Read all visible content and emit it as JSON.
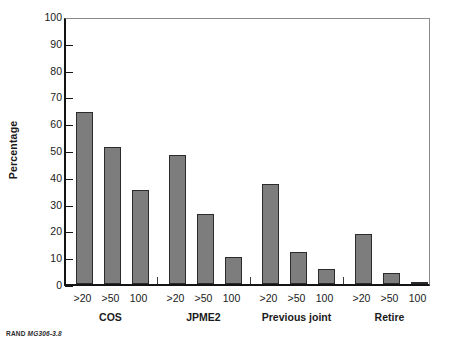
{
  "footer": {
    "prefix": "RAND",
    "figure_id": "MG306-3.8"
  },
  "chart_data": {
    "type": "bar",
    "title": "",
    "xlabel": "",
    "ylabel": "Percentage",
    "ylim": [
      0,
      100
    ],
    "ytick_step": 10,
    "ytick_labels": [
      "0",
      "10",
      "20",
      "30",
      "40",
      "50",
      "60",
      "70",
      "80",
      "90",
      "100"
    ],
    "grid": false,
    "legend": "none",
    "categories": [
      "COS",
      "JPME2",
      "Previous joint",
      "Retire"
    ],
    "subcategories": [
      ">20",
      ">50",
      "100"
    ],
    "groups": [
      {
        "label": "COS",
        "bars": [
          {
            "label": ">20",
            "value": 64
          },
          {
            "label": ">50",
            "value": 51
          },
          {
            "label": "100",
            "value": 35
          }
        ]
      },
      {
        "label": "JPME2",
        "bars": [
          {
            "label": ">20",
            "value": 48
          },
          {
            "label": ">50",
            "value": 26
          },
          {
            "label": "100",
            "value": 10
          }
        ]
      },
      {
        "label": "Previous joint",
        "bars": [
          {
            "label": ">20",
            "value": 37.5
          },
          {
            "label": ">50",
            "value": 12
          },
          {
            "label": "100",
            "value": 5.5
          }
        ]
      },
      {
        "label": "Retire",
        "bars": [
          {
            "label": ">20",
            "value": 18.5
          },
          {
            "label": ">50",
            "value": 4
          },
          {
            "label": "100",
            "value": 0.7
          }
        ]
      }
    ],
    "colors": {
      "bar_fill": "#7d7d7d",
      "bar_border": "#2b2b2b",
      "axis": "#141414",
      "frame": "#8a8a8a",
      "text": "#1a1a1a"
    }
  }
}
